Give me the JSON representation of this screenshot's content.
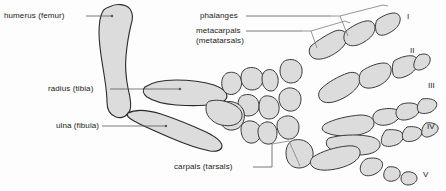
{
  "figure": {
    "background_color": "#fdfdfd",
    "bone_fill": "#dcdcdc",
    "bone_stroke": "#2b2b2b",
    "leader_color": "#555555",
    "text_color": "#1a1a1a"
  },
  "labels": {
    "humerus": "humerus (femur)",
    "radius": "radius (tibia)",
    "ulna": "ulna (fibula)",
    "phalanges": "phalanges",
    "metacarpals": "metacarpals",
    "metatarsals": "(metatarsals)",
    "carpals": "carpals (tarsals)"
  },
  "digits": [
    {
      "numeral": "I"
    },
    {
      "numeral": "II"
    },
    {
      "numeral": "III"
    },
    {
      "numeral": "IV"
    },
    {
      "numeral": "V"
    }
  ]
}
